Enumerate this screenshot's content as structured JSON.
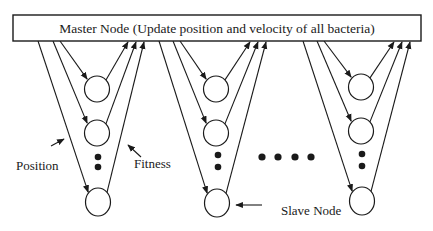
{
  "master_node": {
    "label": "Master Node (Update position and velocity of all bacteria)",
    "box": {
      "x": 13,
      "y": 15,
      "w": 408,
      "h": 26
    }
  },
  "labels": {
    "position": "Position",
    "fitness": "Fitness",
    "slave_node": "Slave Node"
  },
  "colors": {
    "stroke": "#1a1a1a",
    "background": "#ffffff"
  },
  "groups": [
    {
      "name": "group-1",
      "down_starts": [
        38,
        53,
        60
      ],
      "up_ends": [
        128,
        136,
        144
      ],
      "nodes": [
        {
          "cx": 97,
          "cy": 89
        },
        {
          "cx": 97,
          "cy": 133
        },
        {
          "cx": 98,
          "cy": 202
        }
      ],
      "vdots": [
        {
          "cx": 98,
          "cy": 157
        },
        {
          "cx": 98,
          "cy": 167
        }
      ]
    },
    {
      "name": "group-2",
      "down_starts": [
        159,
        173,
        180
      ],
      "up_ends": [
        250,
        258,
        266
      ],
      "nodes": [
        {
          "cx": 216,
          "cy": 89
        },
        {
          "cx": 216,
          "cy": 133
        },
        {
          "cx": 217,
          "cy": 203
        }
      ],
      "vdots": [
        {
          "cx": 218,
          "cy": 155
        },
        {
          "cx": 218,
          "cy": 167
        }
      ]
    },
    {
      "name": "group-3",
      "down_starts": [
        303,
        317,
        324
      ],
      "up_ends": [
        394,
        402,
        410
      ],
      "nodes": [
        {
          "cx": 361,
          "cy": 87
        },
        {
          "cx": 361,
          "cy": 131
        },
        {
          "cx": 362,
          "cy": 201
        }
      ],
      "vdots": [
        {
          "cx": 362,
          "cy": 154
        },
        {
          "cx": 362,
          "cy": 166
        }
      ]
    }
  ],
  "hdots": [
    {
      "cx": 262,
      "cy": 157
    },
    {
      "cx": 278,
      "cy": 157
    },
    {
      "cx": 295,
      "cy": 157
    },
    {
      "cx": 311,
      "cy": 157
    }
  ]
}
